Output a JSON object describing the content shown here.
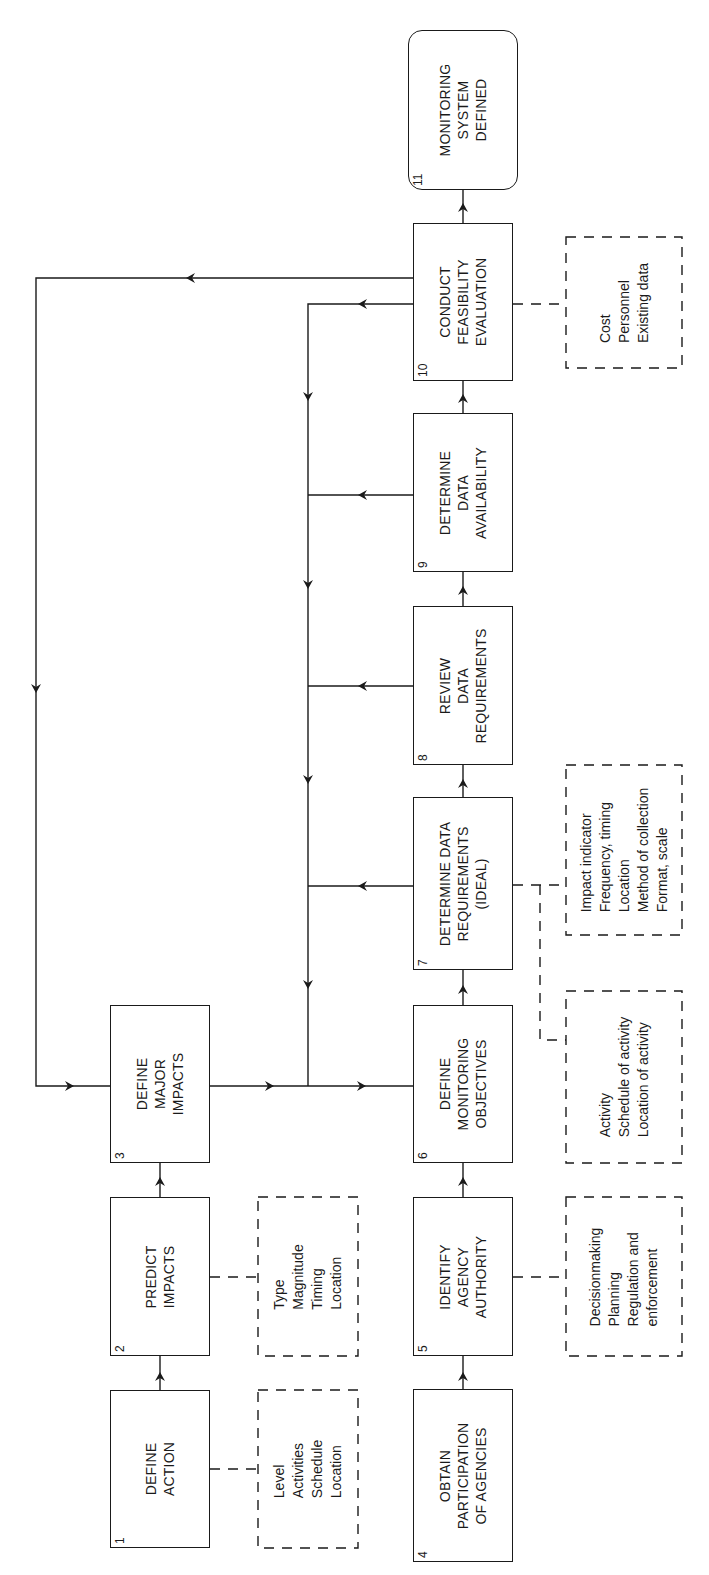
{
  "diagram": {
    "type": "flowchart",
    "orientation": "rotated-90-ccw",
    "steps": [
      {
        "id": "1",
        "number": "1",
        "lines": [
          "DEFINE",
          "ACTION"
        ]
      },
      {
        "id": "2",
        "number": "2",
        "lines": [
          "PREDICT",
          "IMPACTS"
        ]
      },
      {
        "id": "3",
        "number": "3",
        "lines": [
          "DEFINE",
          "MAJOR",
          "IMPACTS"
        ]
      },
      {
        "id": "4",
        "number": "4",
        "lines": [
          "OBTAIN",
          "PARTICIPATION",
          "OF AGENCIES"
        ]
      },
      {
        "id": "5",
        "number": "5",
        "lines": [
          "IDENTIFY",
          "AGENCY",
          "AUTHORITY"
        ]
      },
      {
        "id": "6",
        "number": "6",
        "lines": [
          "DEFINE",
          "MONITORING",
          "OBJECTIVES"
        ]
      },
      {
        "id": "7",
        "number": "7",
        "lines": [
          "DETERMINE DATA",
          "REQUIREMENTS",
          "(IDEAL)"
        ]
      },
      {
        "id": "8",
        "number": "8",
        "lines": [
          "REVIEW",
          "DATA",
          "REQUIREMENTS"
        ]
      },
      {
        "id": "9",
        "number": "9",
        "lines": [
          "DETERMINE",
          "DATA",
          "AVAILABILITY"
        ]
      },
      {
        "id": "10",
        "number": "10",
        "lines": [
          "CONDUCT",
          "FEASIBILITY",
          "EVALUATION"
        ]
      },
      {
        "id": "11",
        "number": "11",
        "lines": [
          "MONITORING",
          "SYSTEM",
          "DEFINED"
        ],
        "shape": "rounded"
      }
    ],
    "notes": [
      {
        "attached_to": "1",
        "items": [
          "Level",
          "Activities",
          "Schedule",
          "Location"
        ]
      },
      {
        "attached_to": "2",
        "items": [
          "Type",
          "Magnitude",
          "Timing",
          "Location"
        ]
      },
      {
        "attached_to": "5",
        "items": [
          "Decisionmaking",
          "Planning",
          "Regulation and",
          "enforcement"
        ]
      },
      {
        "attached_to": "7",
        "items": [
          "Activity",
          "Schedule of activity",
          "Location of activity"
        ]
      },
      {
        "attached_to": "7",
        "items": [
          "Impact indicator",
          "Frequency, timing",
          "Location",
          "Method of collection",
          "Format, scale"
        ]
      },
      {
        "attached_to": "10",
        "items": [
          "Cost",
          "Personnel",
          "Existing data"
        ]
      }
    ],
    "edges": [
      {
        "from": "1",
        "to": "2"
      },
      {
        "from": "2",
        "to": "3"
      },
      {
        "from": "3",
        "to": "6"
      },
      {
        "from": "4",
        "to": "5"
      },
      {
        "from": "5",
        "to": "6"
      },
      {
        "from": "6",
        "to": "7"
      },
      {
        "from": "7",
        "to": "8"
      },
      {
        "from": "8",
        "to": "9"
      },
      {
        "from": "9",
        "to": "10"
      },
      {
        "from": "10",
        "to": "11"
      },
      {
        "from": "7",
        "to": "6",
        "type": "feedback"
      },
      {
        "from": "8",
        "to": "6",
        "type": "feedback"
      },
      {
        "from": "9",
        "to": "6",
        "type": "feedback"
      },
      {
        "from": "10",
        "to": "6",
        "type": "feedback"
      },
      {
        "from": "10",
        "to": "3",
        "type": "feedback"
      }
    ],
    "colors": {
      "stroke": "#1a1a1a",
      "background": "#ffffff"
    }
  }
}
